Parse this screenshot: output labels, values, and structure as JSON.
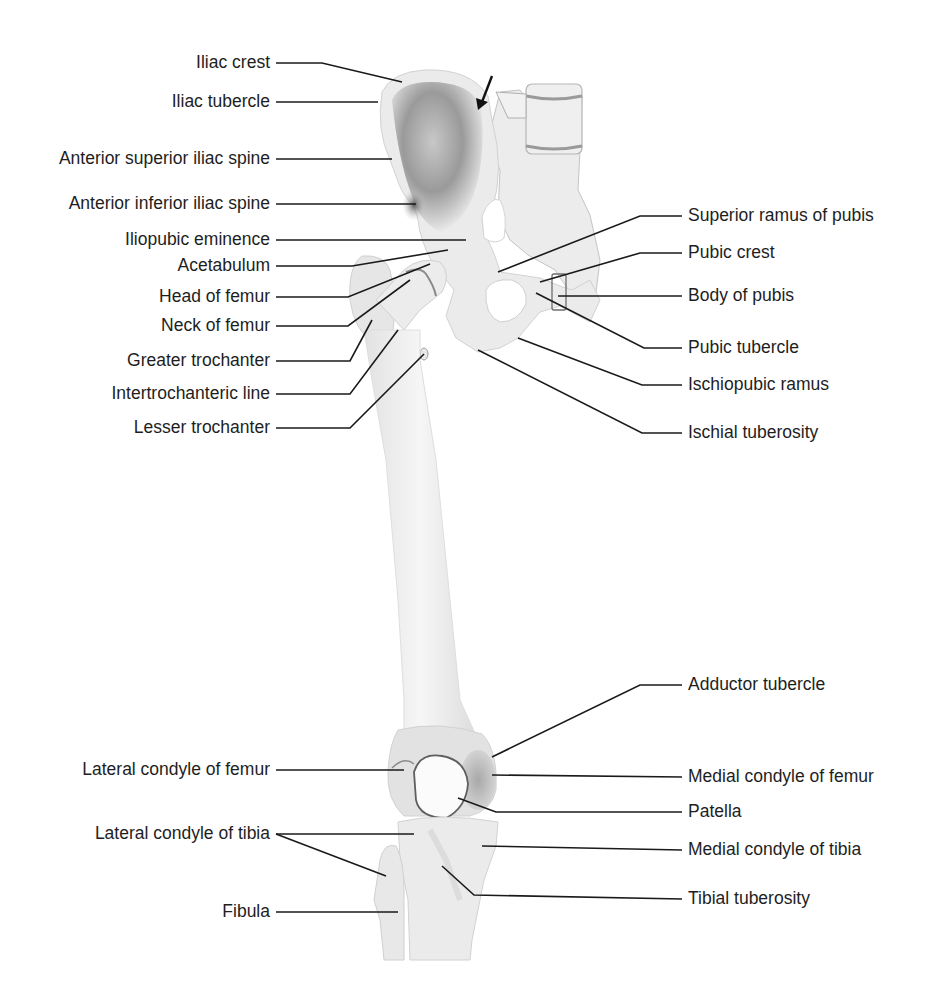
{
  "diagram": {
    "colors": {
      "bone": "#ececec",
      "bone_shadow": "#8a8a8a",
      "line": "#1a1a1a",
      "text": "#1e1e1e"
    }
  },
  "labels_left": [
    {
      "id": "iliac-crest",
      "text": "Iliac crest",
      "x": 270,
      "y": 63,
      "line": [
        [
          276,
          63
        ],
        [
          322,
          63
        ],
        [
          402,
          82
        ]
      ]
    },
    {
      "id": "iliac-tubercle",
      "text": "Iliac tubercle",
      "x": 270,
      "y": 102,
      "line": [
        [
          276,
          102
        ],
        [
          378,
          102
        ]
      ]
    },
    {
      "id": "anterior-superior-iliac-spine",
      "text": "Anterior superior iliac spine",
      "x": 270,
      "y": 159,
      "line": [
        [
          276,
          159
        ],
        [
          392,
          159
        ]
      ]
    },
    {
      "id": "anterior-inferior-iliac-spine",
      "text": "Anterior inferior iliac spine",
      "x": 270,
      "y": 204,
      "line": [
        [
          276,
          204
        ],
        [
          416,
          204
        ]
      ]
    },
    {
      "id": "iliopubic-eminence",
      "text": "Iliopubic eminence",
      "x": 270,
      "y": 240,
      "line": [
        [
          276,
          240
        ],
        [
          466,
          240
        ]
      ]
    },
    {
      "id": "acetabulum",
      "text": "Acetabulum",
      "x": 270,
      "y": 266,
      "line": [
        [
          276,
          266
        ],
        [
          352,
          266
        ],
        [
          448,
          250
        ]
      ]
    },
    {
      "id": "head-of-femur",
      "text": "Head of femur",
      "x": 270,
      "y": 297,
      "line": [
        [
          276,
          297
        ],
        [
          348,
          297
        ],
        [
          430,
          264
        ]
      ]
    },
    {
      "id": "neck-of-femur",
      "text": "Neck of femur",
      "x": 270,
      "y": 326,
      "line": [
        [
          276,
          326
        ],
        [
          348,
          326
        ],
        [
          410,
          280
        ]
      ]
    },
    {
      "id": "greater-trochanter",
      "text": "Greater trochanter",
      "x": 270,
      "y": 361,
      "line": [
        [
          276,
          361
        ],
        [
          350,
          361
        ],
        [
          372,
          320
        ]
      ]
    },
    {
      "id": "intertrochanteric-line",
      "text": "Intertrochanteric line",
      "x": 270,
      "y": 394,
      "line": [
        [
          276,
          394
        ],
        [
          350,
          394
        ],
        [
          398,
          330
        ]
      ]
    },
    {
      "id": "lesser-trochanter",
      "text": "Lesser trochanter",
      "x": 270,
      "y": 428,
      "line": [
        [
          276,
          428
        ],
        [
          350,
          428
        ],
        [
          424,
          354
        ]
      ]
    },
    {
      "id": "lateral-condyle-of-femur",
      "text": "Lateral condyle of femur",
      "x": 270,
      "y": 770,
      "line": [
        [
          276,
          770
        ],
        [
          404,
          770
        ]
      ]
    },
    {
      "id": "lateral-condyle-of-tibia",
      "text": "Lateral condyle of tibia",
      "x": 270,
      "y": 834,
      "line": [
        [
          276,
          834
        ],
        [
          414,
          834
        ]
      ],
      "line2": [
        [
          276,
          834
        ],
        [
          386,
          876
        ]
      ]
    },
    {
      "id": "fibula",
      "text": "Fibula",
      "x": 270,
      "y": 912,
      "line": [
        [
          276,
          912
        ],
        [
          398,
          912
        ]
      ]
    }
  ],
  "labels_right": [
    {
      "id": "superior-ramus-of-pubis",
      "text": "Superior ramus of pubis",
      "x": 688,
      "y": 216,
      "line": [
        [
          682,
          216
        ],
        [
          640,
          216
        ],
        [
          498,
          272
        ]
      ]
    },
    {
      "id": "pubic-crest",
      "text": "Pubic crest",
      "x": 688,
      "y": 253,
      "line": [
        [
          682,
          253
        ],
        [
          640,
          253
        ],
        [
          540,
          282
        ]
      ]
    },
    {
      "id": "body-of-pubis",
      "text": "Body of pubis",
      "x": 688,
      "y": 296,
      "line": [
        [
          682,
          296
        ],
        [
          558,
          296
        ]
      ]
    },
    {
      "id": "pubic-tubercle",
      "text": "Pubic tubercle",
      "x": 688,
      "y": 348,
      "line": [
        [
          682,
          348
        ],
        [
          644,
          348
        ],
        [
          536,
          293
        ]
      ]
    },
    {
      "id": "ischiopubic-ramus",
      "text": "Ischiopubic ramus",
      "x": 688,
      "y": 385,
      "line": [
        [
          682,
          385
        ],
        [
          642,
          385
        ],
        [
          518,
          338
        ]
      ]
    },
    {
      "id": "ischial-tuberosity",
      "text": "Ischial tuberosity",
      "x": 688,
      "y": 433,
      "line": [
        [
          682,
          433
        ],
        [
          642,
          433
        ],
        [
          478,
          350
        ]
      ]
    },
    {
      "id": "adductor-tubercle",
      "text": "Adductor tubercle",
      "x": 688,
      "y": 685,
      "line": [
        [
          682,
          685
        ],
        [
          640,
          685
        ],
        [
          492,
          757
        ]
      ]
    },
    {
      "id": "medial-condyle-of-femur",
      "text": "Medial condyle of femur",
      "x": 688,
      "y": 777,
      "line": [
        [
          682,
          777
        ],
        [
          492,
          775
        ]
      ]
    },
    {
      "id": "patella",
      "text": "Patella",
      "x": 688,
      "y": 812,
      "line": [
        [
          682,
          812
        ],
        [
          496,
          812
        ],
        [
          458,
          798
        ]
      ]
    },
    {
      "id": "medial-condyle-of-tibia",
      "text": "Medial condyle of tibia",
      "x": 688,
      "y": 850,
      "line": [
        [
          682,
          850
        ],
        [
          482,
          846
        ]
      ]
    },
    {
      "id": "tibial-tuberosity",
      "text": "Tibial tuberosity",
      "x": 688,
      "y": 899,
      "line": [
        [
          682,
          899
        ],
        [
          474,
          895
        ],
        [
          442,
          866
        ]
      ]
    }
  ],
  "arrow": {
    "from": [
      492,
      76
    ],
    "to": [
      480,
      107
    ]
  }
}
